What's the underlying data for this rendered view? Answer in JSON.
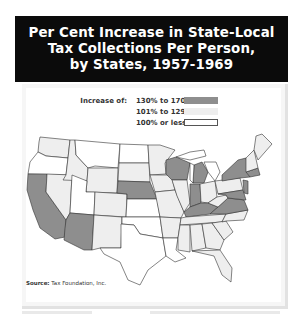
{
  "title": {
    "lines": [
      "Per Cent Increase in State-Local",
      "Tax Collections Per Person,",
      "by States, 1957-1969"
    ]
  },
  "legend": {
    "lead": "Increase of:",
    "items": [
      {
        "label": "130% to 170%",
        "color": "#8e8e8e",
        "key": "high"
      },
      {
        "label": "101% to 129%",
        "color": "#eeeeee",
        "key": "mid"
      },
      {
        "label": "100% or less",
        "color": "#ffffff",
        "key": "low"
      }
    ]
  },
  "source": {
    "prefix": "Source:",
    "text": "Tax Foundation, Inc."
  },
  "map_data": {
    "type": "choropleth",
    "region": "Continental United States",
    "categories": {
      "high": "130% to 170%",
      "mid": "101% to 129%",
      "low": "100% or less"
    },
    "states": {
      "WA": "mid",
      "OR": "low",
      "CA": "high",
      "NV": "mid",
      "ID": "mid",
      "MT": "low",
      "WY": "mid",
      "UT": "low",
      "AZ": "high",
      "CO": "mid",
      "NM": "mid",
      "ND": "low",
      "SD": "mid",
      "NE": "high",
      "KS": "low",
      "OK": "low",
      "TX": "low",
      "MN": "mid",
      "IA": "mid",
      "MO": "mid",
      "AR": "mid",
      "LA": "low",
      "WI": "high",
      "IL": "mid",
      "MI": "high",
      "IN": "high",
      "OH": "mid",
      "KY": "high",
      "TN": "mid",
      "MS": "mid",
      "AL": "mid",
      "GA": "mid",
      "FL": "mid",
      "SC": "mid",
      "NC": "mid",
      "VA": "high",
      "WV": "mid",
      "MD": "high",
      "DE": "high",
      "PA": "mid",
      "NJ": "high",
      "NY": "high",
      "CT": "high",
      "RI": "high",
      "MA": "high",
      "VT": "mid",
      "NH": "mid",
      "ME": "mid"
    }
  }
}
